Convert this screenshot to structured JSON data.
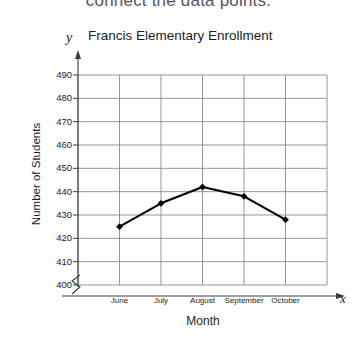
{
  "worksheet": {
    "prompt_text": "connect the data points."
  },
  "chart_data": {
    "type": "line",
    "title": "Francis Elementary Enrollment",
    "xlabel": "Month",
    "ylabel": "Number of Students",
    "x_axis_letter": "y",
    "y_axis_letter": "x",
    "categories": [
      "June",
      "July",
      "August",
      "September",
      "October"
    ],
    "values": [
      425,
      435,
      442,
      438,
      428
    ],
    "y_ticks": [
      400,
      410,
      420,
      430,
      440,
      450,
      460,
      470,
      480,
      490
    ],
    "ylim": [
      400,
      490
    ],
    "axis_break": true,
    "grid": true,
    "legend": "none",
    "marker": "diamond",
    "line_color": "#000000",
    "grid_color": "#8a8a8a"
  }
}
